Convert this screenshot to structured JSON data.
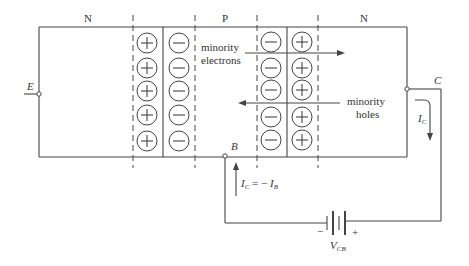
{
  "figure": {
    "type": "PNP transistor junction diagram (common-base, reverse-biased collector)",
    "regions": [
      {
        "label": "N",
        "position": "left (emitter)"
      },
      {
        "label": "P",
        "position": "middle (base)"
      },
      {
        "label": "N",
        "position": "right (collector)"
      }
    ],
    "left_junction": {
      "left_column_ions": [
        "+",
        "+",
        "+",
        "+",
        "+"
      ],
      "right_column_ions": [
        "−",
        "−",
        "−",
        "−",
        "−"
      ]
    },
    "right_junction": {
      "left_column_ions": [
        "−",
        "−",
        "−",
        "−",
        "−"
      ],
      "right_column_ions": [
        "+",
        "+",
        "+",
        "+",
        "+"
      ]
    },
    "annotations": {
      "minority_electrons": {
        "line1": "minority",
        "line2": "electrons",
        "arrow_direction": "right"
      },
      "minority_holes": {
        "line1": "minority",
        "line2": "holes",
        "arrow_direction": "left"
      }
    },
    "terminals": {
      "emitter": "E",
      "base": "B",
      "collector": "C"
    },
    "currents": {
      "collector_current": {
        "symbol": "I",
        "subscript": "C"
      },
      "relation": {
        "lhs": "I",
        "lhs_sub": "C",
        "op": " = − ",
        "rhs": "I",
        "rhs_sub": "B"
      }
    },
    "battery": {
      "label": "V",
      "subscript": "CB",
      "neg_sign": "−",
      "pos_sign": "+"
    }
  }
}
